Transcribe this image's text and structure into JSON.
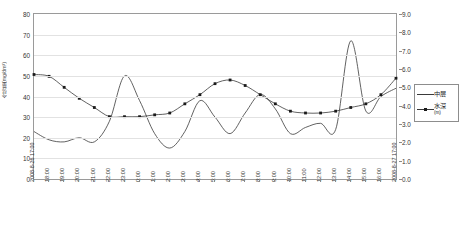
{
  "chart_data": {
    "type": "line",
    "title": "",
    "xlabel": "",
    "ylabel": "含沙量(mg/dm³)",
    "y2label": "水深 (m)",
    "ylim": [
      0,
      80
    ],
    "y2lim": [
      0.0,
      9.0
    ],
    "grid": true,
    "legend_position": "right",
    "yticks": [
      "0",
      "10",
      "20",
      "30",
      "40",
      "50",
      "60",
      "70",
      "80"
    ],
    "y2ticks": [
      "0.0",
      "1.0",
      "2.0",
      "3.0",
      "4.0",
      "5.0",
      "6.0",
      "7.0",
      "8.0",
      "9.0"
    ],
    "categories": [
      "2008-8-26 17:00",
      "18:00",
      "19:00",
      "20:00",
      "21:00",
      "22:00",
      "23:00",
      "0:00",
      "1:00",
      "2:00",
      "3:00",
      "4:00",
      "5:00",
      "6:00",
      "7:00",
      "8:00",
      "9:00",
      "10:00",
      "11:00",
      "12:00",
      "13:00",
      "14:00",
      "15:00",
      "16:00",
      "2008-8-27 17:00"
    ],
    "series": [
      {
        "name": "中层",
        "axis": "left",
        "marker": false,
        "values": [
          23,
          19,
          18,
          20,
          18,
          28,
          50,
          38,
          22,
          15,
          23,
          38,
          30,
          22,
          32,
          41,
          34,
          22,
          25,
          27,
          24,
          67,
          33,
          40,
          44
        ]
      },
      {
        "name": "水深",
        "unit": "(m)",
        "axis": "right",
        "marker": true,
        "values": [
          5.7,
          5.6,
          5.0,
          4.4,
          3.9,
          3.4,
          3.4,
          3.4,
          3.5,
          3.6,
          4.1,
          4.6,
          5.2,
          5.4,
          5.1,
          4.6,
          4.1,
          3.7,
          3.6,
          3.6,
          3.7,
          3.9,
          4.1,
          4.6,
          5.5
        ]
      }
    ]
  },
  "legend": {
    "items": [
      {
        "label": "中层",
        "unit": ""
      },
      {
        "label": "水深",
        "unit": "(m)"
      }
    ]
  }
}
